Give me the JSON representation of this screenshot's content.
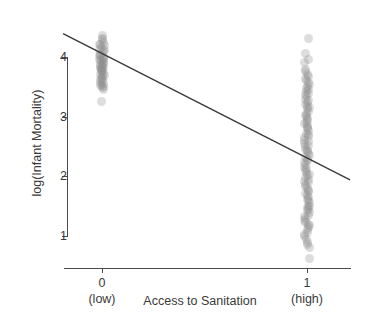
{
  "chart_data": {
    "type": "scatter",
    "title": "",
    "subtitle": "",
    "xlabel": "Access to Sanitation",
    "ylabel": "log(Infant Mortality)",
    "xlim": [
      -0.19,
      1.21
    ],
    "ylim": [
      0.46,
      4.53
    ],
    "grid": false,
    "legend": null,
    "x_ticks": [
      {
        "value": 0,
        "label": "0",
        "sublabel": "(low)"
      },
      {
        "value": 1,
        "label": "1",
        "sublabel": "(high)"
      }
    ],
    "y_ticks": [
      {
        "value": 1,
        "label": "1"
      },
      {
        "value": 2,
        "label": "2"
      },
      {
        "value": 3,
        "label": "3"
      },
      {
        "value": 4,
        "label": "4"
      }
    ],
    "point_color": "#8e8e8e",
    "point_opacity": 0.3,
    "point_radius_px": 4.5,
    "line_color": "#3a3a3a",
    "axis_color": "#4a4a4a",
    "fit_line": {
      "type": "linear",
      "label": "regression line",
      "x_start": -0.19,
      "y_start": 4.39,
      "x_end": 1.21,
      "y_end": 1.94,
      "intercept_at_x0": 4.06,
      "value_at_x1": 2.32,
      "slope": -1.74
    },
    "series": [
      {
        "name": "Low access to sanitation",
        "x": 0,
        "values": [
          4.35,
          4.33,
          4.3,
          4.26,
          4.22,
          4.2,
          4.18,
          4.15,
          4.13,
          4.11,
          4.09,
          4.07,
          4.05,
          4.03,
          4.02,
          4.0,
          3.99,
          3.97,
          3.96,
          3.94,
          3.93,
          3.91,
          3.9,
          3.88,
          3.87,
          3.85,
          3.84,
          3.82,
          3.81,
          3.79,
          3.78,
          3.76,
          3.75,
          3.73,
          3.72,
          3.7,
          3.68,
          3.66,
          3.64,
          3.62,
          3.6,
          3.58,
          3.56,
          3.54,
          3.52,
          3.5,
          3.48,
          3.46,
          3.25
        ],
        "count": 49
      },
      {
        "name": "High access to sanitation",
        "x": 1,
        "values": [
          4.3,
          4.05,
          3.95,
          3.9,
          3.8,
          3.76,
          3.72,
          3.68,
          3.64,
          3.6,
          3.57,
          3.54,
          3.51,
          3.48,
          3.45,
          3.42,
          3.39,
          3.36,
          3.33,
          3.3,
          3.27,
          3.24,
          3.21,
          3.18,
          3.15,
          3.12,
          3.09,
          3.06,
          3.03,
          3.0,
          2.97,
          2.94,
          2.91,
          2.88,
          2.85,
          2.82,
          2.79,
          2.76,
          2.73,
          2.7,
          2.67,
          2.64,
          2.61,
          2.58,
          2.55,
          2.52,
          2.49,
          2.46,
          2.43,
          2.4,
          2.37,
          2.34,
          2.31,
          2.28,
          2.25,
          2.22,
          2.19,
          2.16,
          2.13,
          2.1,
          2.07,
          2.04,
          2.01,
          1.98,
          1.95,
          1.92,
          1.89,
          1.86,
          1.83,
          1.8,
          1.77,
          1.74,
          1.71,
          1.68,
          1.65,
          1.62,
          1.59,
          1.56,
          1.53,
          1.5,
          1.47,
          1.44,
          1.41,
          1.38,
          1.35,
          1.32,
          1.29,
          1.26,
          1.23,
          1.2,
          1.17,
          1.14,
          1.1,
          1.06,
          1.02,
          0.98,
          0.94,
          0.9,
          0.86,
          0.82,
          0.62
        ],
        "count": 101
      }
    ]
  }
}
